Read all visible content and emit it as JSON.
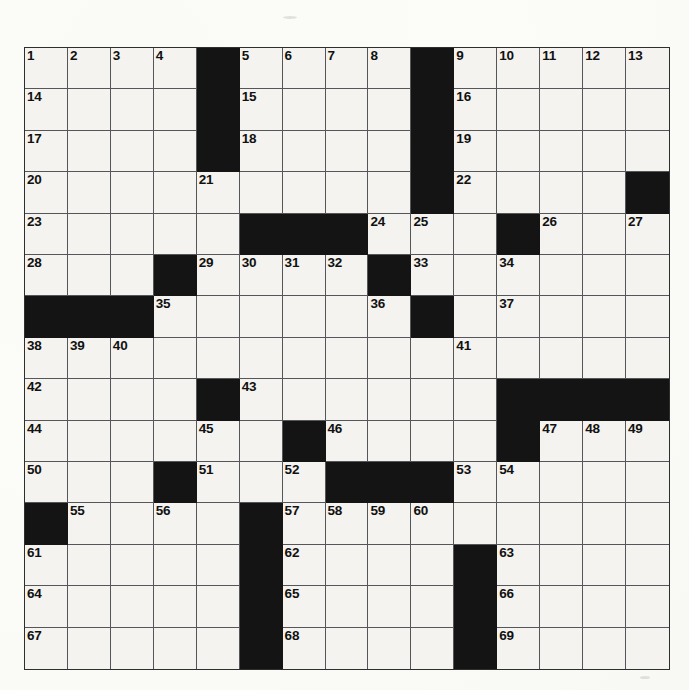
{
  "document": {
    "kind": "crossword-puzzle-grid",
    "title": "Crossword Puzzle",
    "background_color": "#fdfdfb",
    "block_color": "#141414",
    "cell_color": "#f4f3ef",
    "grid_line_color": "#55565a",
    "number_color": "#111111"
  },
  "grid": {
    "columns": 15,
    "rows": 15,
    "total_cells": 225,
    "cell_width_px": 43,
    "cell_height_px": 41.5,
    "origin_x_px": 24,
    "origin_y_px": 47,
    "width_px": 646,
    "height_px": 623,
    "legend": {
      "0": "open (white) square",
      "1": "blocked (black) square"
    },
    "blocks": [
      [
        0,
        0,
        0,
        0,
        1,
        0,
        0,
        0,
        0,
        1,
        0,
        0,
        0,
        0,
        0
      ],
      [
        0,
        0,
        0,
        0,
        1,
        0,
        0,
        0,
        0,
        1,
        0,
        0,
        0,
        0,
        0
      ],
      [
        0,
        0,
        0,
        0,
        1,
        0,
        0,
        0,
        0,
        1,
        0,
        0,
        0,
        0,
        0
      ],
      [
        0,
        0,
        0,
        0,
        0,
        0,
        0,
        0,
        0,
        1,
        0,
        0,
        0,
        0,
        1
      ],
      [
        0,
        0,
        0,
        0,
        0,
        1,
        1,
        1,
        0,
        0,
        0,
        1,
        0,
        0,
        0
      ],
      [
        0,
        0,
        0,
        1,
        0,
        0,
        0,
        0,
        1,
        0,
        0,
        0,
        0,
        0,
        0
      ],
      [
        1,
        1,
        1,
        0,
        0,
        0,
        0,
        0,
        0,
        1,
        0,
        0,
        0,
        0,
        0
      ],
      [
        0,
        0,
        0,
        0,
        0,
        0,
        0,
        0,
        0,
        0,
        0,
        0,
        0,
        0,
        0
      ],
      [
        0,
        0,
        0,
        0,
        1,
        0,
        0,
        0,
        0,
        0,
        0,
        1,
        1,
        1,
        1
      ],
      [
        0,
        0,
        0,
        0,
        0,
        0,
        1,
        0,
        0,
        0,
        0,
        1,
        0,
        0,
        0
      ],
      [
        0,
        0,
        0,
        1,
        0,
        0,
        0,
        1,
        1,
        1,
        0,
        0,
        0,
        0,
        0
      ],
      [
        1,
        0,
        0,
        0,
        0,
        1,
        0,
        0,
        0,
        0,
        0,
        0,
        0,
        0,
        0
      ],
      [
        0,
        0,
        0,
        0,
        0,
        1,
        0,
        0,
        0,
        0,
        1,
        0,
        0,
        0,
        0
      ],
      [
        0,
        0,
        0,
        0,
        0,
        1,
        0,
        0,
        0,
        0,
        1,
        0,
        0,
        0,
        0
      ],
      [
        0,
        0,
        0,
        0,
        0,
        1,
        0,
        0,
        0,
        0,
        1,
        0,
        0,
        0,
        0
      ]
    ],
    "numbers": [
      {
        "row": 0,
        "col": 0,
        "n": "1"
      },
      {
        "row": 0,
        "col": 1,
        "n": "2"
      },
      {
        "row": 0,
        "col": 2,
        "n": "3"
      },
      {
        "row": 0,
        "col": 3,
        "n": "4"
      },
      {
        "row": 0,
        "col": 5,
        "n": "5"
      },
      {
        "row": 0,
        "col": 6,
        "n": "6"
      },
      {
        "row": 0,
        "col": 7,
        "n": "7"
      },
      {
        "row": 0,
        "col": 8,
        "n": "8"
      },
      {
        "row": 0,
        "col": 10,
        "n": "9"
      },
      {
        "row": 0,
        "col": 11,
        "n": "10"
      },
      {
        "row": 0,
        "col": 12,
        "n": "11"
      },
      {
        "row": 0,
        "col": 13,
        "n": "12"
      },
      {
        "row": 0,
        "col": 14,
        "n": "13"
      },
      {
        "row": 1,
        "col": 0,
        "n": "14"
      },
      {
        "row": 1,
        "col": 5,
        "n": "15"
      },
      {
        "row": 1,
        "col": 10,
        "n": "16"
      },
      {
        "row": 2,
        "col": 0,
        "n": "17"
      },
      {
        "row": 2,
        "col": 5,
        "n": "18"
      },
      {
        "row": 2,
        "col": 10,
        "n": "19"
      },
      {
        "row": 3,
        "col": 0,
        "n": "20"
      },
      {
        "row": 3,
        "col": 4,
        "n": "21"
      },
      {
        "row": 3,
        "col": 10,
        "n": "22"
      },
      {
        "row": 4,
        "col": 0,
        "n": "23"
      },
      {
        "row": 4,
        "col": 8,
        "n": "24"
      },
      {
        "row": 4,
        "col": 9,
        "n": "25"
      },
      {
        "row": 4,
        "col": 12,
        "n": "26"
      },
      {
        "row": 4,
        "col": 14,
        "n": "27"
      },
      {
        "row": 5,
        "col": 0,
        "n": "28"
      },
      {
        "row": 5,
        "col": 4,
        "n": "29"
      },
      {
        "row": 5,
        "col": 5,
        "n": "30"
      },
      {
        "row": 5,
        "col": 6,
        "n": "31"
      },
      {
        "row": 5,
        "col": 7,
        "n": "32"
      },
      {
        "row": 5,
        "col": 9,
        "n": "33"
      },
      {
        "row": 5,
        "col": 11,
        "n": "34"
      },
      {
        "row": 6,
        "col": 3,
        "n": "35"
      },
      {
        "row": 6,
        "col": 8,
        "n": "36"
      },
      {
        "row": 6,
        "col": 11,
        "n": "37"
      },
      {
        "row": 7,
        "col": 0,
        "n": "38"
      },
      {
        "row": 7,
        "col": 1,
        "n": "39"
      },
      {
        "row": 7,
        "col": 2,
        "n": "40"
      },
      {
        "row": 7,
        "col": 10,
        "n": "41"
      },
      {
        "row": 8,
        "col": 0,
        "n": "42"
      },
      {
        "row": 8,
        "col": 5,
        "n": "43"
      },
      {
        "row": 9,
        "col": 0,
        "n": "44"
      },
      {
        "row": 9,
        "col": 4,
        "n": "45"
      },
      {
        "row": 9,
        "col": 7,
        "n": "46"
      },
      {
        "row": 9,
        "col": 12,
        "n": "47"
      },
      {
        "row": 9,
        "col": 13,
        "n": "48"
      },
      {
        "row": 9,
        "col": 14,
        "n": "49"
      },
      {
        "row": 10,
        "col": 0,
        "n": "50"
      },
      {
        "row": 10,
        "col": 4,
        "n": "51"
      },
      {
        "row": 10,
        "col": 6,
        "n": "52"
      },
      {
        "row": 10,
        "col": 10,
        "n": "53"
      },
      {
        "row": 10,
        "col": 11,
        "n": "54"
      },
      {
        "row": 11,
        "col": 1,
        "n": "55"
      },
      {
        "row": 11,
        "col": 3,
        "n": "56"
      },
      {
        "row": 11,
        "col": 6,
        "n": "57"
      },
      {
        "row": 11,
        "col": 7,
        "n": "58"
      },
      {
        "row": 11,
        "col": 8,
        "n": "59"
      },
      {
        "row": 11,
        "col": 9,
        "n": "60"
      },
      {
        "row": 12,
        "col": 0,
        "n": "61"
      },
      {
        "row": 12,
        "col": 6,
        "n": "62"
      },
      {
        "row": 12,
        "col": 11,
        "n": "63"
      },
      {
        "row": 13,
        "col": 0,
        "n": "64"
      },
      {
        "row": 13,
        "col": 6,
        "n": "65"
      },
      {
        "row": 13,
        "col": 11,
        "n": "66"
      },
      {
        "row": 14,
        "col": 0,
        "n": "67"
      },
      {
        "row": 14,
        "col": 6,
        "n": "68"
      },
      {
        "row": 14,
        "col": 11,
        "n": "69"
      }
    ],
    "letters": []
  }
}
